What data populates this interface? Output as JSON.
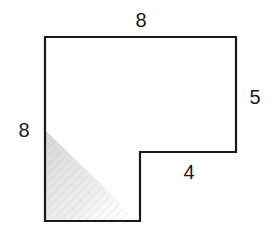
{
  "figure": {
    "type": "l-shaped-polygon",
    "stroke_color": "#1a1a1a",
    "fill_color": "#ffffff",
    "shading_color": "#d8d8d8",
    "vertices": [
      [
        45,
        37
      ],
      [
        236,
        37
      ],
      [
        236,
        152
      ],
      [
        140,
        152
      ],
      [
        140,
        221
      ],
      [
        45,
        221
      ]
    ],
    "labels": [
      {
        "id": "top",
        "text": "8",
        "x": 141,
        "y": 20
      },
      {
        "id": "right",
        "text": "5",
        "x": 255,
        "y": 97
      },
      {
        "id": "left",
        "text": "8",
        "x": 24,
        "y": 130
      },
      {
        "id": "inner-step",
        "text": "4",
        "x": 189,
        "y": 172
      }
    ]
  }
}
